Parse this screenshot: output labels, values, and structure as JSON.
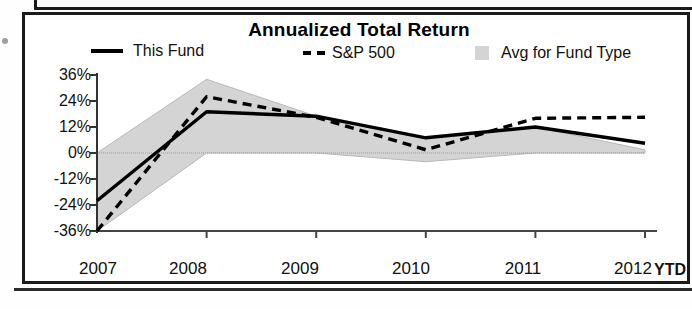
{
  "chart_data": {
    "type": "line",
    "title": "Annualized Total Return",
    "xlabel": "",
    "ylabel": "",
    "categories": [
      "2007",
      "2008",
      "2009",
      "2010",
      "2011",
      "2012"
    ],
    "x_axis_suffix": "YTD",
    "ylim": [
      -36,
      36
    ],
    "ytick_labels": [
      "36%",
      "24%",
      "12%",
      "0%",
      "-12%",
      "-24%",
      "-36%"
    ],
    "yticks": [
      36,
      24,
      12,
      0,
      -12,
      -24,
      -36
    ],
    "grid": false,
    "legend_position": "top",
    "series": [
      {
        "name": "This Fund",
        "style": "solid",
        "color": "#000000",
        "values": [
          -22,
          19,
          17,
          7,
          12,
          4.5
        ]
      },
      {
        "name": "S&P 500",
        "style": "dashed",
        "color": "#000000",
        "values": [
          -36,
          26,
          16.5,
          1.5,
          16,
          16.5
        ]
      },
      {
        "name": "Avg for Fund Type",
        "style": "band",
        "color": "#d4d4d4",
        "upper": [
          0,
          34,
          17,
          7,
          12,
          1.5
        ],
        "lower": [
          -36,
          0,
          0,
          -4,
          0,
          0
        ]
      }
    ]
  },
  "legend": {
    "items": [
      {
        "label": "This Fund",
        "marker": "solid-line-icon"
      },
      {
        "label": "S&P 500",
        "marker": "dashed-line-icon"
      },
      {
        "label": "Avg for Fund Type",
        "marker": "gray-square-swatch-icon"
      }
    ]
  },
  "axis": {
    "y_ticks": [
      "36%",
      "24%",
      "12%",
      "0%",
      "-12%",
      "-24%",
      "-36%"
    ],
    "x_ticks": [
      "2007",
      "2008",
      "2009",
      "2010",
      "2011",
      "2012"
    ],
    "x_suffix": "YTD"
  }
}
